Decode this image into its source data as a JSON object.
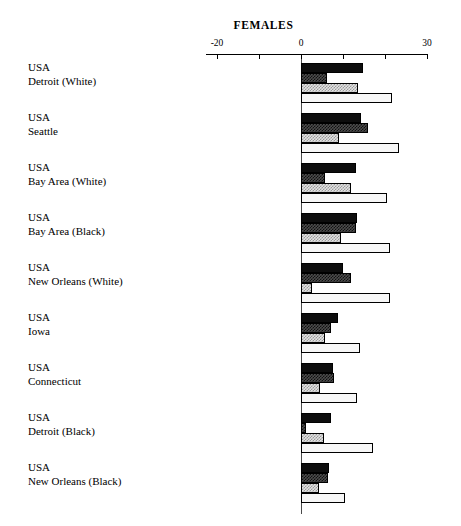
{
  "chart_data": {
    "type": "bar",
    "orientation": "horizontal",
    "title": "FEMALES",
    "xlabel": "",
    "ylabel": "",
    "xlim": [
      -20,
      30
    ],
    "xticks": [
      -20,
      -10,
      0,
      10,
      20,
      30
    ],
    "xtick_labels": [
      "-20",
      "",
      "0",
      "",
      "",
      "30"
    ],
    "grid": false,
    "legend": "none",
    "categories": [
      "USA\nDetroit (White)",
      "USA\nSeattle",
      "USA\nBay Area (White)",
      "USA\nBay Area (Black)",
      "USA\nNew Orleans (White)",
      "USA\nIowa",
      "USA\nConnecticut",
      "USA\nDetroit (Black)",
      "USA\nNew Orleans (Black)"
    ],
    "series": [
      {
        "name": "series-1",
        "style": "solid-black",
        "values": [
          14.8,
          14.3,
          13.1,
          13.3,
          10.0,
          8.8,
          7.6,
          7.1,
          6.7
        ]
      },
      {
        "name": "series-2",
        "style": "dark-hatch",
        "values": [
          6.2,
          16.0,
          5.7,
          13.1,
          11.9,
          7.1,
          7.9,
          1.2,
          6.4
        ]
      },
      {
        "name": "series-3",
        "style": "light-hatch",
        "values": [
          13.6,
          9.0,
          11.9,
          9.5,
          2.6,
          5.7,
          4.5,
          5.5,
          4.3
        ]
      },
      {
        "name": "series-4",
        "style": "white-fill",
        "values": [
          21.7,
          23.3,
          20.5,
          21.2,
          21.2,
          14.0,
          13.3,
          17.1,
          10.5
        ]
      }
    ]
  },
  "axis": {
    "tick_labels": [
      {
        "value": -20,
        "label": "-20"
      },
      {
        "value": -10,
        "label": ""
      },
      {
        "value": 0,
        "label": "0"
      },
      {
        "value": 10,
        "label": ""
      },
      {
        "value": 20,
        "label": ""
      },
      {
        "value": 30,
        "label": "30"
      }
    ]
  },
  "labels": [
    {
      "line1": "USA",
      "line2": "Detroit (White)"
    },
    {
      "line1": "USA",
      "line2": "Seattle"
    },
    {
      "line1": "USA",
      "line2": "Bay Area (White)"
    },
    {
      "line1": "USA",
      "line2": "Bay Area (Black)"
    },
    {
      "line1": "USA",
      "line2": "New Orleans (White)"
    },
    {
      "line1": "USA",
      "line2": "Iowa"
    },
    {
      "line1": "USA",
      "line2": "Connecticut"
    },
    {
      "line1": "USA",
      "line2": "Detroit (Black)"
    },
    {
      "line1": "USA",
      "line2": "New Orleans (Black)"
    }
  ],
  "colors": {
    "series_1": "#0d0d0d",
    "series_2": "#4d4d4d",
    "series_3": "#e3e3e3",
    "series_4": "#f7f7f7",
    "axis": "#000000",
    "background": "#ffffff"
  }
}
